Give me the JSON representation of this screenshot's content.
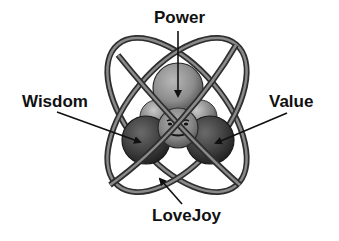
{
  "diagram": {
    "type": "atom-model",
    "labels": {
      "top": "Power",
      "left": "Wisdom",
      "right": "Value",
      "bottom": "LoveJoy"
    },
    "nucleus": {
      "center_face": "smiley-face",
      "spheres": [
        "Power",
        "Wisdom",
        "Value"
      ]
    },
    "orbits": 2,
    "colors": {
      "background": "#ffffff",
      "text": "#111111",
      "orbit_dark": "#3a3a3a",
      "orbit_light": "#8a8a8a",
      "sphere_light": "#a8a8a8",
      "sphere_dark": "#3c3c3c",
      "arrow": "#111111"
    }
  }
}
